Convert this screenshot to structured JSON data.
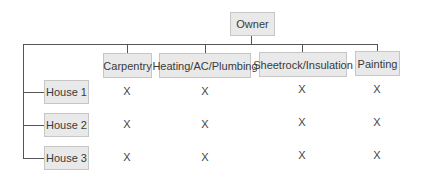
{
  "diagram": {
    "root": {
      "label": "Owner"
    },
    "trades": [
      {
        "label": "Carpentry"
      },
      {
        "label": "Heating/AC/Plumbing"
      },
      {
        "label": "Sheetrock/Insulation"
      },
      {
        "label": "Painting"
      }
    ],
    "houses": [
      {
        "label": "House 1",
        "marks": [
          "X",
          "X",
          "X",
          "X"
        ]
      },
      {
        "label": "House 2",
        "marks": [
          "X",
          "X",
          "X",
          "X"
        ]
      },
      {
        "label": "House 3",
        "marks": [
          "X",
          "X",
          "X",
          "X"
        ]
      }
    ]
  },
  "colors": {
    "box_fill": "#e9e9e9",
    "box_border": "#c6c6c6",
    "line": "#555555",
    "text": "#3a3a3a"
  }
}
